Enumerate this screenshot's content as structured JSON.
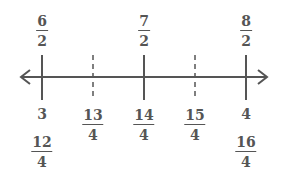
{
  "number_line": {
    "description": "Number line from 3 to 4 showing halves and fourths",
    "ticks": [
      {
        "x": 42,
        "style": "solid",
        "top_label": {
          "num": "6",
          "den": "2"
        },
        "bottom_label": "3",
        "bottom_frac": {
          "num": "12",
          "den": "4"
        }
      },
      {
        "x": 93,
        "style": "dashed",
        "bottom_frac": {
          "num": "13",
          "den": "4"
        }
      },
      {
        "x": 144,
        "style": "solid",
        "top_label": {
          "num": "7",
          "den": "2"
        },
        "bottom_frac": {
          "num": "14",
          "den": "4"
        }
      },
      {
        "x": 195,
        "style": "dashed",
        "bottom_frac": {
          "num": "15",
          "den": "4"
        }
      },
      {
        "x": 246,
        "style": "solid",
        "top_label": {
          "num": "8",
          "den": "2"
        },
        "bottom_label": "4",
        "bottom_frac": {
          "num": "16",
          "den": "4"
        }
      }
    ],
    "colors": {
      "line": "#555555"
    }
  }
}
